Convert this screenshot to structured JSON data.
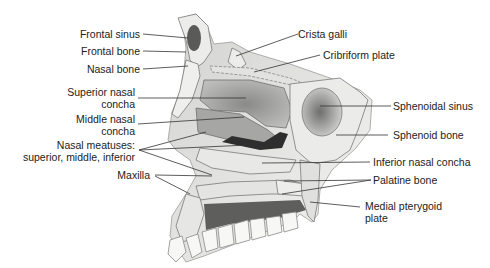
{
  "figure": {
    "colors": {
      "background": "#ffffff",
      "bone": "#e6e6e4",
      "bone_edge": "#7a7a78",
      "soft_shade": "#b8b8b6",
      "dark_cavity": "#3a3a3a",
      "label_text": "#222222",
      "leader_line": "#333333"
    }
  },
  "labels": {
    "left": [
      {
        "text": "Frontal sinus"
      },
      {
        "text": "Frontal bone"
      },
      {
        "text": "Nasal bone"
      },
      {
        "line1": "Superior nasal",
        "line2": "concha"
      },
      {
        "line1": "Middle nasal",
        "line2": "concha"
      },
      {
        "line1": "Nasal meatuses:",
        "line2": "superior, middle, inferior"
      },
      {
        "text": "Maxilla"
      }
    ],
    "right": [
      {
        "text": "Crista galli"
      },
      {
        "text": "Cribriform plate"
      },
      {
        "text": "Sphenoidal sinus"
      },
      {
        "text": "Sphenoid bone"
      },
      {
        "text": "Inferior nasal concha"
      },
      {
        "text": "Palatine bone"
      },
      {
        "line1": "Medial pterygoid",
        "line2": "plate"
      }
    ]
  }
}
